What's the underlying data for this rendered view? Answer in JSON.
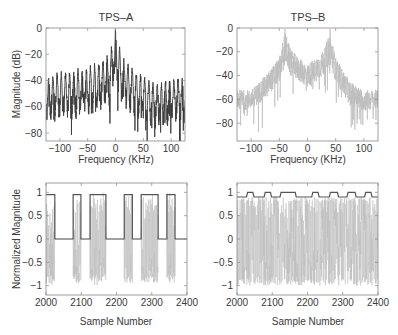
{
  "figure": {
    "panels": [
      {
        "id": "tps-a-spectrum",
        "title": "TPS–A"
      },
      {
        "id": "tps-b-spectrum",
        "title": "TPS–B"
      },
      {
        "id": "tps-a-time",
        "title": ""
      },
      {
        "id": "tps-b-time",
        "title": ""
      }
    ]
  },
  "colors": {
    "dark_trace": "#3c3c3c",
    "light_trace": "#bdbdbd",
    "envelope": "#555555",
    "axes": "#888888",
    "text": "#3a3a3a"
  },
  "chart_data": [
    {
      "type": "line",
      "title": "TPS–A",
      "xlabel": "Frequency (KHz)",
      "ylabel": "Magnitude (dB)",
      "xlim": [
        -125,
        125
      ],
      "ylim": [
        -86,
        0
      ],
      "xticks": [
        -100,
        -50,
        0,
        50,
        100
      ],
      "xtick_labels": [
        "−100",
        "−50",
        "0",
        "50",
        "100"
      ],
      "yticks": [
        0,
        -20,
        -40,
        -60,
        -80
      ],
      "ytick_labels": [
        "0",
        "−20",
        "−40",
        "−60",
        "−80"
      ],
      "grid": false,
      "series": [
        {
          "name": "TPS-A spectrum",
          "color": "#3c3c3c",
          "description": "Dense spectrum with comb of lobes every ~7.5 KHz; peak near 0 KHz at ~0 dB, main lobe -5 to -25 dB within ±8 KHz; side lobe peaks decay from ~-18 dB near ±15 KHz to ~-35 dB at edges; floor ~-55 dB with nulls to -80 dB",
          "envelope_x": [
            -125,
            -100,
            -75,
            -50,
            -25,
            -10,
            -5,
            0,
            5,
            10,
            25,
            50,
            75,
            100,
            125
          ],
          "upper_envelope_db": [
            -35,
            -33,
            -31,
            -28,
            -24,
            -18,
            -8,
            0,
            -8,
            -18,
            -28,
            -36,
            -42,
            -38,
            -35
          ],
          "floor_db": [
            -55,
            -53,
            -52,
            -50,
            -45,
            -40,
            -30,
            -20,
            -30,
            -40,
            -47,
            -55,
            -58,
            -56,
            -55
          ]
        }
      ]
    },
    {
      "type": "line",
      "title": "TPS–B",
      "xlabel": "Frequency (KHz)",
      "ylabel": "",
      "xlim": [
        -125,
        125
      ],
      "ylim": [
        -95,
        0
      ],
      "xticks": [
        -100,
        -50,
        0,
        50,
        100
      ],
      "xtick_labels": [
        "−100",
        "−50",
        "0",
        "50",
        "100"
      ],
      "yticks": [
        0,
        -20,
        -40,
        -60,
        -80
      ],
      "ytick_labels": [
        "0",
        "−20",
        "−40",
        "−60",
        "−80"
      ],
      "grid": false,
      "series": [
        {
          "name": "TPS-B spectrum",
          "color": "#bdbdbd",
          "description": "Two carrier peaks at about ±40 KHz reaching ~0 dB; band between them ~-20 to -50 dB; outer skirts fall to ~-60 dB floor with nulls to -90 dB",
          "envelope_x": [
            -125,
            -100,
            -75,
            -50,
            -40,
            -30,
            -15,
            0,
            15,
            30,
            40,
            50,
            75,
            100,
            125
          ],
          "upper_envelope_db": [
            -52,
            -52,
            -40,
            -25,
            -2,
            -18,
            -25,
            -30,
            -25,
            -18,
            -2,
            -25,
            -45,
            -52,
            -52
          ],
          "floor_db": [
            -70,
            -68,
            -60,
            -45,
            -30,
            -40,
            -45,
            -50,
            -45,
            -40,
            -30,
            -45,
            -65,
            -70,
            -68
          ]
        }
      ]
    },
    {
      "type": "line",
      "title": "",
      "xlabel": "Sample Number",
      "ylabel": "Normalized Magnitude",
      "xlim": [
        2000,
        2400
      ],
      "ylim": [
        -1.2,
        1.2
      ],
      "xticks": [
        2000,
        2100,
        2200,
        2300,
        2400
      ],
      "xtick_labels": [
        "2000",
        "2100",
        "2200",
        "2300",
        "2400"
      ],
      "yticks": [
        1,
        0.5,
        0,
        -0.5,
        -1
      ],
      "ytick_labels": [
        "1",
        "0.5",
        "0",
        "−0.5",
        "−1"
      ],
      "grid": false,
      "series": [
        {
          "name": "signal",
          "color": "#bdbdbd",
          "description": "Oscillating waveform bursts between -1 and 1 inside ON intervals, ~0 elsewhere"
        },
        {
          "name": "envelope",
          "color": "#555555",
          "on_level": 0.95,
          "off_level": 0.0,
          "on_intervals": [
            [
              2000,
              2025
            ],
            [
              2077,
              2099
            ],
            [
              2125,
              2170
            ],
            [
              2222,
              2245
            ],
            [
              2270,
              2318
            ],
            [
              2343,
              2366
            ]
          ]
        }
      ]
    },
    {
      "type": "line",
      "title": "",
      "xlabel": "Sample Number",
      "ylabel": "",
      "xlim": [
        2000,
        2400
      ],
      "ylim": [
        -1.2,
        1.2
      ],
      "xticks": [
        2000,
        2100,
        2200,
        2300,
        2400
      ],
      "xtick_labels": [
        "2000",
        "2100",
        "2200",
        "2300",
        "2400"
      ],
      "yticks": [
        1,
        0.5,
        0,
        -0.5,
        -1
      ],
      "ytick_labels": [
        "1",
        "0.5",
        "0",
        "−0.5",
        "−1"
      ],
      "grid": false,
      "series": [
        {
          "name": "signal",
          "color": "#bdbdbd",
          "description": "Continuous oscillating waveform spanning -1 to ~0.9 across the whole range"
        },
        {
          "name": "envelope",
          "color": "#555555",
          "high_level": 1.0,
          "low_level": 0.9,
          "high_intervals": [
            [
              2030,
              2045
            ],
            [
              2080,
              2095
            ],
            [
              2125,
              2165
            ],
            [
              2215,
              2230
            ],
            [
              2265,
              2285
            ],
            [
              2315,
              2335
            ],
            [
              2365,
              2380
            ]
          ]
        }
      ]
    }
  ]
}
